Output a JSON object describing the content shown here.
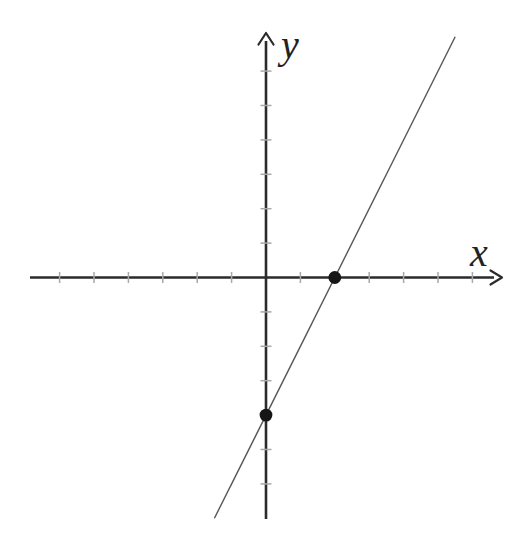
{
  "figure": {
    "background": "#ffffff",
    "colors": {
      "axis": "#2b2b2b",
      "line": "#565656",
      "tick": "#a8a8a8",
      "point": "#161616",
      "label": "#222222"
    }
  },
  "chart_data": {
    "type": "line",
    "title": "",
    "xlabel": "x",
    "ylabel": "y",
    "xlim": [
      -6.8,
      6.8
    ],
    "ylim": [
      -7.1,
      7.1
    ],
    "grid": false,
    "legend": false,
    "tick_step": 1,
    "x_ticks": [
      -6,
      -5,
      -4,
      -3,
      -2,
      -1,
      1,
      2,
      3,
      4,
      5,
      6
    ],
    "y_ticks": [
      -6,
      -5,
      -4,
      -3,
      -2,
      -1,
      1,
      2,
      3,
      4,
      5,
      6
    ],
    "series": [
      {
        "name": "y = 2x - 4",
        "slope": 2,
        "intercept": -4,
        "x_range": [
          -1.5,
          5.5
        ]
      }
    ],
    "marked_points": [
      {
        "x": 2,
        "y": 0
      },
      {
        "x": 0,
        "y": -4
      }
    ]
  }
}
